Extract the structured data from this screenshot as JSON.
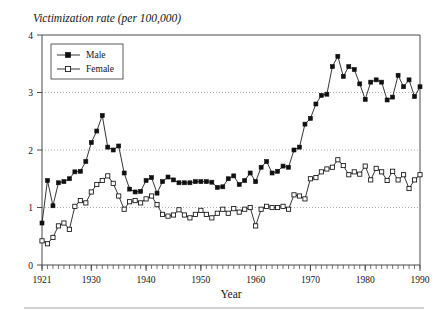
{
  "chart_data": {
    "type": "line",
    "title": "Victimization rate (per 100,000)",
    "xlabel": "Year",
    "ylabel": "",
    "xlim": [
      1921,
      1990
    ],
    "ylim": [
      0,
      4
    ],
    "yticks": [
      0,
      1,
      2,
      3,
      4
    ],
    "ytick_labels": [
      "0",
      "1",
      "2",
      "3",
      "4"
    ],
    "xticks": [
      1921,
      1930,
      1940,
      1950,
      1960,
      1970,
      1980,
      1990
    ],
    "xtick_labels": [
      "1921",
      "1930",
      "1940",
      "1950",
      "1960",
      "1970",
      "1980",
      "1990"
    ],
    "grid": "horizontal-dotted at y = 1, 2, 3",
    "legend_position": "top-left inside axes",
    "x": [
      1921,
      1922,
      1923,
      1924,
      1925,
      1926,
      1927,
      1928,
      1929,
      1930,
      1931,
      1932,
      1933,
      1934,
      1935,
      1936,
      1937,
      1938,
      1939,
      1940,
      1941,
      1942,
      1943,
      1944,
      1945,
      1946,
      1947,
      1948,
      1949,
      1950,
      1951,
      1952,
      1953,
      1954,
      1955,
      1956,
      1957,
      1958,
      1959,
      1960,
      1961,
      1962,
      1963,
      1964,
      1965,
      1966,
      1967,
      1968,
      1969,
      1970,
      1971,
      1972,
      1973,
      1974,
      1975,
      1976,
      1977,
      1978,
      1979,
      1980,
      1981,
      1982,
      1983,
      1984,
      1985,
      1986,
      1987,
      1988,
      1989,
      1990
    ],
    "series": [
      {
        "name": "Male",
        "marker": "filled-square",
        "values": [
          0.73,
          1.47,
          1.03,
          1.43,
          1.45,
          1.5,
          1.62,
          1.63,
          1.8,
          2.13,
          2.33,
          2.6,
          2.05,
          2.0,
          2.07,
          1.6,
          1.32,
          1.27,
          1.28,
          1.47,
          1.52,
          1.25,
          1.45,
          1.53,
          1.48,
          1.43,
          1.43,
          1.43,
          1.45,
          1.45,
          1.45,
          1.44,
          1.35,
          1.36,
          1.5,
          1.55,
          1.4,
          1.47,
          1.6,
          1.45,
          1.7,
          1.8,
          1.6,
          1.63,
          1.72,
          1.7,
          2.0,
          2.05,
          2.45,
          2.55,
          2.8,
          2.95,
          2.97,
          3.45,
          3.63,
          3.28,
          3.45,
          3.4,
          3.15,
          2.88,
          3.18,
          3.22,
          3.18,
          2.87,
          2.92,
          3.3,
          3.1,
          3.22,
          2.93,
          3.1
        ],
        "note_peak": {
          "year": 1975,
          "value": 3.63
        }
      },
      {
        "name": "Female",
        "marker": "open-square",
        "values": [
          0.42,
          0.37,
          0.48,
          0.68,
          0.73,
          0.62,
          1.02,
          1.12,
          1.08,
          1.27,
          1.4,
          1.47,
          1.55,
          1.42,
          1.2,
          0.97,
          1.1,
          1.12,
          1.08,
          1.15,
          1.2,
          1.05,
          0.88,
          0.85,
          0.87,
          0.96,
          0.87,
          0.82,
          0.88,
          0.95,
          0.88,
          0.82,
          0.9,
          0.97,
          0.9,
          0.98,
          0.92,
          0.97,
          1.0,
          0.68,
          0.97,
          1.02,
          1.0,
          1.0,
          1.02,
          0.97,
          1.22,
          1.2,
          1.15,
          1.5,
          1.52,
          1.62,
          1.67,
          1.7,
          1.83,
          1.73,
          1.57,
          1.62,
          1.58,
          1.72,
          1.48,
          1.68,
          1.62,
          1.47,
          1.63,
          1.48,
          1.57,
          1.33,
          1.48,
          1.57
        ]
      }
    ]
  },
  "legend": {
    "entries": [
      {
        "label": "Male"
      },
      {
        "label": "Female"
      }
    ]
  },
  "colors": {
    "line": "#101010",
    "frame": "#4a4a4a",
    "grid": "#8c8c8c",
    "background": "#ffffff"
  }
}
